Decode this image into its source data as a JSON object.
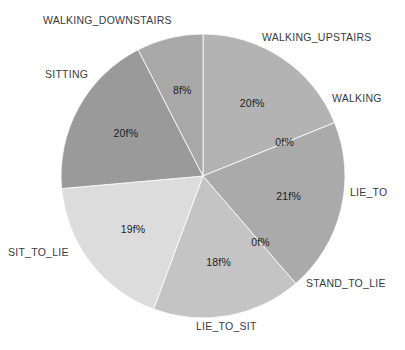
{
  "chart_data": {
    "type": "pie",
    "title": "",
    "subtitle": "",
    "xlabel": "",
    "ylabel": "",
    "legend_position": "none",
    "grid": false,
    "label_format": "{value}f%",
    "categories": [
      "WALKING_UPSTAIRS",
      "WALKING",
      "LIE_TO",
      "STAND_TO_LIE",
      "LIE_TO_SIT",
      "SIT_TO_LIE",
      "SITTING",
      "WALKING_DOWNSTAIRS"
    ],
    "values": [
      20,
      0,
      21,
      0,
      18,
      19,
      20,
      8
    ],
    "slice_labels": [
      "20f%",
      "0f%",
      "21f%",
      "0f%",
      "18f%",
      "19f%",
      "20f%",
      "8f%"
    ],
    "colors": [
      "#b3b3b3",
      "#b3b3b3",
      "#aaaaaa",
      "#aaaaaa",
      "#c4c4c4",
      "#dcdcdc",
      "#9a9a9a",
      "#a8a8a8"
    ],
    "background": "#ffffff",
    "text_color": "#2b2b2b"
  },
  "labels": {
    "walking_downstairs": "WALKING_DOWNSTAIRS",
    "walking_upstairs": "WALKING_UPSTAIRS",
    "sitting": "SITTING",
    "walking": "WALKING",
    "lie_to": "LIE_TO",
    "stand_to_lie": "STAND_TO_LIE",
    "lie_to_sit": "LIE_TO_SIT",
    "sit_to_lie": "SIT_TO_LIE"
  },
  "percentages": {
    "walking_downstairs": "8f%",
    "walking_upstairs": "20f%",
    "walking": "0f%",
    "lie_to": "21f%",
    "stand_to_lie": "0f%",
    "lie_to_sit": "18f%",
    "sit_to_lie": "19f%",
    "sitting": "20f%"
  }
}
